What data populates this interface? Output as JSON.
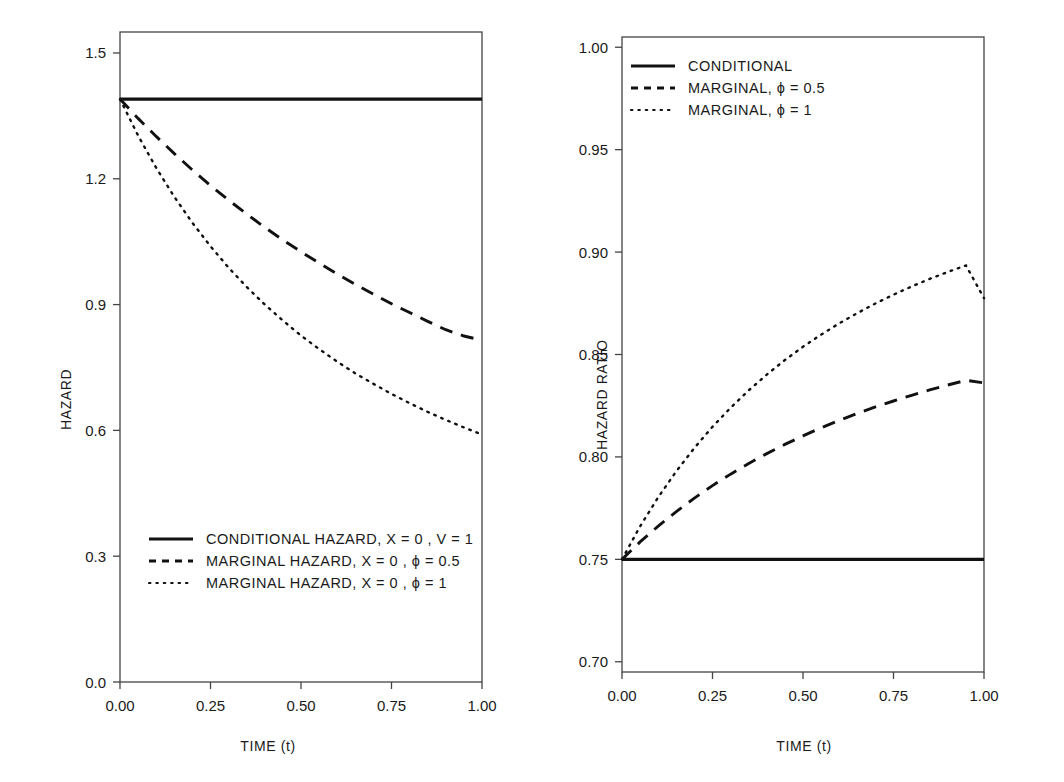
{
  "chart_data": [
    {
      "panel": "left",
      "type": "line",
      "title": "",
      "xlabel": "TIME (t)",
      "ylabel": "HAZARD",
      "xlim": [
        0.0,
        1.0
      ],
      "ylim": [
        0.0,
        1.55
      ],
      "xticks": [
        "0.00",
        "0.25",
        "0.50",
        "0.75",
        "1.00"
      ],
      "xtick_values": [
        0.0,
        0.25,
        0.5,
        0.75,
        1.0
      ],
      "yticks": [
        "0.0",
        "0.3",
        "0.6",
        "0.9",
        "1.2",
        "1.5"
      ],
      "ytick_values": [
        0.0,
        0.3,
        0.6,
        0.9,
        1.2,
        1.5
      ],
      "grid": false,
      "legend_position": "bottom-left",
      "x": [
        0.0,
        0.05,
        0.1,
        0.15,
        0.2,
        0.25,
        0.3,
        0.35,
        0.4,
        0.45,
        0.5,
        0.55,
        0.6,
        0.65,
        0.7,
        0.75,
        0.8,
        0.85,
        0.9,
        0.95,
        1.0
      ],
      "series": [
        {
          "name": "CONDITIONAL  HAZARD,  X = 0 , V = 1",
          "style": "solid",
          "values": [
            1.39,
            1.39,
            1.39,
            1.39,
            1.39,
            1.39,
            1.39,
            1.39,
            1.39,
            1.39,
            1.39,
            1.39,
            1.39,
            1.39,
            1.39,
            1.39,
            1.39,
            1.39,
            1.39,
            1.39,
            1.39
          ]
        },
        {
          "name": "MARGINAL  HAZARD,  X = 0 , ϕ = 0.5",
          "style": "dashed",
          "values": [
            1.39,
            1.344,
            1.301,
            1.26,
            1.221,
            1.184,
            1.149,
            1.116,
            1.084,
            1.054,
            1.026,
            0.999,
            0.973,
            0.948,
            0.925,
            0.902,
            0.881,
            0.86,
            0.84,
            0.825,
            0.815
          ]
        },
        {
          "name": "MARGINAL  HAZARD,  X = 0 , ϕ = 1",
          "style": "dotted",
          "values": [
            1.39,
            1.303,
            1.226,
            1.157,
            1.095,
            1.039,
            0.988,
            0.942,
            0.9,
            0.862,
            0.826,
            0.794,
            0.764,
            0.736,
            0.711,
            0.687,
            0.665,
            0.644,
            0.625,
            0.607,
            0.59
          ]
        }
      ]
    },
    {
      "panel": "right",
      "type": "line",
      "title": "",
      "xlabel": "TIME (t)",
      "ylabel": "HAZARD RATIO",
      "xlim": [
        0.0,
        1.0
      ],
      "ylim": [
        0.695,
        1.005
      ],
      "xticks": [
        "0.00",
        "0.25",
        "0.50",
        "0.75",
        "1.00"
      ],
      "xtick_values": [
        0.0,
        0.25,
        0.5,
        0.75,
        1.0
      ],
      "yticks": [
        "0.70",
        "0.75",
        "0.80",
        "0.85",
        "0.90",
        "0.95",
        "1.00"
      ],
      "ytick_values": [
        0.7,
        0.75,
        0.8,
        0.85,
        0.9,
        0.95,
        1.0
      ],
      "grid": false,
      "legend_position": "top-left",
      "x": [
        0.0,
        0.05,
        0.1,
        0.15,
        0.2,
        0.25,
        0.3,
        0.35,
        0.4,
        0.45,
        0.5,
        0.55,
        0.6,
        0.65,
        0.7,
        0.75,
        0.8,
        0.85,
        0.9,
        0.95,
        1.0
      ],
      "series": [
        {
          "name": "CONDITIONAL",
          "style": "solid",
          "values": [
            0.75,
            0.75,
            0.75,
            0.75,
            0.75,
            0.75,
            0.75,
            0.75,
            0.75,
            0.75,
            0.75,
            0.75,
            0.75,
            0.75,
            0.75,
            0.75,
            0.75,
            0.75,
            0.75,
            0.75,
            0.75
          ]
        },
        {
          "name": "MARGINAL, ϕ = 0.5",
          "style": "dashed",
          "values": [
            0.75,
            0.7585,
            0.7662,
            0.7733,
            0.7799,
            0.786,
            0.7916,
            0.7968,
            0.8016,
            0.8061,
            0.8103,
            0.8142,
            0.8178,
            0.8212,
            0.8244,
            0.8273,
            0.8301,
            0.8327,
            0.8351,
            0.8374,
            0.8361
          ]
        },
        {
          "name": "MARGINAL, ϕ = 1",
          "style": "dotted",
          "values": [
            0.75,
            0.7661,
            0.7803,
            0.793,
            0.8044,
            0.8147,
            0.824,
            0.8325,
            0.8402,
            0.8473,
            0.8538,
            0.8597,
            0.8652,
            0.8702,
            0.8749,
            0.8792,
            0.8832,
            0.8869,
            0.8903,
            0.8935,
            0.8775
          ]
        }
      ]
    }
  ],
  "panels": {
    "left": {
      "ylabel": "HAZARD",
      "xlabel": "TIME (t)",
      "yticks": [
        "1.5",
        "1.2",
        "0.9",
        "0.6",
        "0.3",
        "0.0"
      ],
      "xticks": [
        "0.00",
        "0.25",
        "0.50",
        "0.75",
        "1.00"
      ],
      "legend": [
        {
          "key": "solid",
          "label": "CONDITIONAL  HAZARD,  X = 0 , V = 1"
        },
        {
          "key": "dashed",
          "label": "MARGINAL  HAZARD,  X = 0 , ϕ = 0.5"
        },
        {
          "key": "dotted",
          "label": "MARGINAL  HAZARD,  X = 0 , ϕ = 1"
        }
      ]
    },
    "right": {
      "ylabel": "HAZARD RATIO",
      "xlabel": "TIME (t)",
      "yticks": [
        "1.00",
        "0.95",
        "0.90",
        "0.85",
        "0.80",
        "0.75",
        "0.70"
      ],
      "xticks": [
        "0.00",
        "0.25",
        "0.50",
        "0.75",
        "1.00"
      ],
      "legend": [
        {
          "key": "solid",
          "label": "CONDITIONAL"
        },
        {
          "key": "dashed",
          "label": "MARGINAL, ϕ = 0.5"
        },
        {
          "key": "dotted",
          "label": "MARGINAL, ϕ = 1"
        }
      ]
    }
  },
  "colors": {
    "line": "#111111",
    "axis": "#444444",
    "text": "#1a1a1a",
    "background": "#ffffff"
  }
}
